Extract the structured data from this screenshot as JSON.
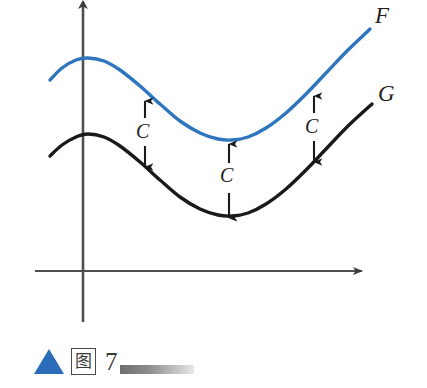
{
  "figure": {
    "title": "",
    "caption": {
      "marker_icon": "blue-triangle-icon",
      "glyph": "图",
      "number": "7",
      "rule": ""
    }
  },
  "axes": {
    "x_axis_label": "",
    "y_axis_label": "",
    "x_arrow": "right-arrow-icon",
    "y_arrow": "up-arrow-icon"
  },
  "annotations": [
    {
      "label": "C",
      "name": "gap-annotation-left"
    },
    {
      "label": "C",
      "name": "gap-annotation-middle"
    },
    {
      "label": "C",
      "name": "gap-annotation-right"
    }
  ],
  "chart_data": {
    "type": "line",
    "title": "",
    "subtitle": "",
    "xlabel": "",
    "ylabel": "",
    "xlim": [
      0,
      427
    ],
    "ylim": [
      0,
      388
    ],
    "grid": false,
    "legend": "inline-end-labels",
    "axis_origin": {
      "x": 82,
      "y": 271
    },
    "colors": {
      "F": "#2e75be",
      "G": "#1a1a1a",
      "axis": "#4f4f4f"
    },
    "series": [
      {
        "name": "F",
        "label": "F",
        "color": "#2e75be",
        "points": [
          [
            50,
            80
          ],
          [
            62,
            68
          ],
          [
            76,
            60
          ],
          [
            88,
            58
          ],
          [
            104,
            61
          ],
          [
            120,
            70
          ],
          [
            140,
            86
          ],
          [
            160,
            104
          ],
          [
            180,
            121
          ],
          [
            200,
            133
          ],
          [
            218,
            139
          ],
          [
            232,
            140
          ],
          [
            248,
            137
          ],
          [
            266,
            128
          ],
          [
            286,
            113
          ],
          [
            306,
            94
          ],
          [
            326,
            73
          ],
          [
            348,
            50
          ],
          [
            370,
            29
          ]
        ]
      },
      {
        "name": "G",
        "label": "G",
        "color": "#1a1a1a",
        "points": [
          [
            50,
            156
          ],
          [
            62,
            145
          ],
          [
            76,
            137
          ],
          [
            88,
            134
          ],
          [
            104,
            137
          ],
          [
            120,
            146
          ],
          [
            140,
            162
          ],
          [
            160,
            180
          ],
          [
            180,
            197
          ],
          [
            200,
            209
          ],
          [
            218,
            215
          ],
          [
            232,
            216
          ],
          [
            248,
            213
          ],
          [
            266,
            204
          ],
          [
            286,
            189
          ],
          [
            306,
            170
          ],
          [
            326,
            149
          ],
          [
            348,
            126
          ],
          [
            372,
            104
          ]
        ]
      }
    ],
    "gap_arrows": [
      {
        "x": 145,
        "y_top": 100,
        "y_bottom": 168,
        "label": "C"
      },
      {
        "x": 229,
        "y_top": 143,
        "y_bottom": 219,
        "label": "C"
      },
      {
        "x": 314,
        "y_top": 95,
        "y_bottom": 163,
        "label": "C"
      }
    ]
  }
}
